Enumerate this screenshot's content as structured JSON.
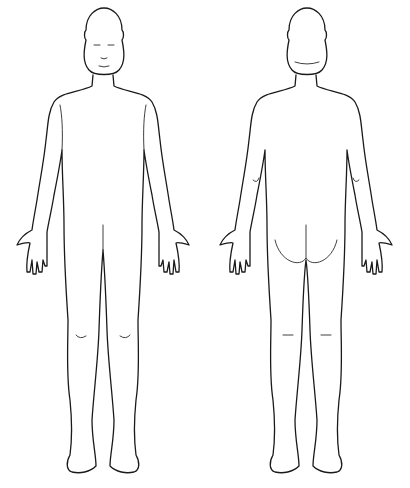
{
  "figures": [
    {
      "id": "front",
      "label": "",
      "view": "anterior"
    },
    {
      "id": "back",
      "label": "",
      "view": "posterior"
    }
  ],
  "colors": {
    "background": "#ffffff",
    "outline": "#1a1a1a"
  }
}
